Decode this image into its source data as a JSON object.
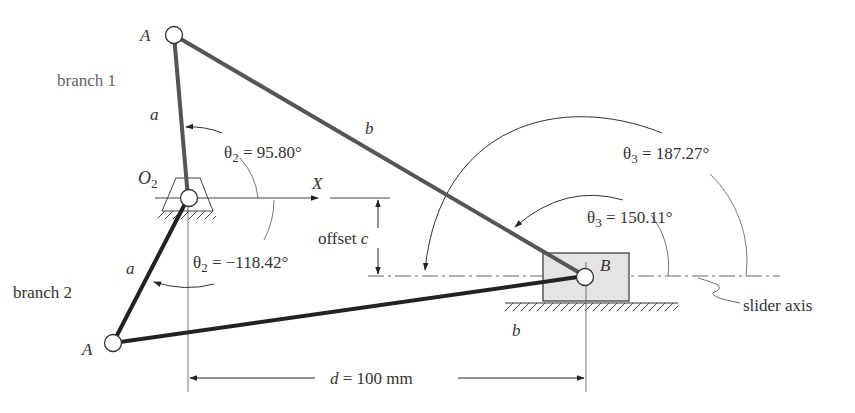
{
  "diagram": {
    "colors": {
      "branch1_link": "#555555",
      "branch2_link": "#222222",
      "thin_line": "#444444",
      "slider_fill": "#e4e4e4",
      "text": "#333333",
      "branch_label": "#666666"
    },
    "labels": {
      "branch1": "branch 1",
      "branch2": "branch 2",
      "pin_A_top": "A",
      "pin_A_bottom": "A",
      "pin_O2": "O",
      "pin_O2_sub": "2",
      "pin_B": "B",
      "link_a_top": "a",
      "link_a_bottom": "a",
      "link_b_top": "b",
      "link_b_bottom": "b",
      "x_axis": "X",
      "offset": "offset ",
      "offset_var": "c",
      "slider_axis": "slider axis",
      "d_var": "d",
      "d_value": " = 100 mm"
    },
    "angles": {
      "theta2_branch1": {
        "symbol": "θ",
        "sub": "2",
        "value": " = 95.80°"
      },
      "theta2_branch2": {
        "symbol": "θ",
        "sub": "2",
        "value": " = −118.42°"
      },
      "theta3_branch1": {
        "symbol": "θ",
        "sub": "3",
        "value": "  = 150.11°"
      },
      "theta3_branch2": {
        "symbol": "θ",
        "sub": "3",
        "value": "  = 187.27°"
      }
    },
    "dimensions": {
      "d_mm": 100,
      "theta2_branch1_deg": 95.8,
      "theta2_branch2_deg": -118.42,
      "theta3_branch1_deg": 150.11,
      "theta3_branch2_deg": 187.27
    }
  }
}
